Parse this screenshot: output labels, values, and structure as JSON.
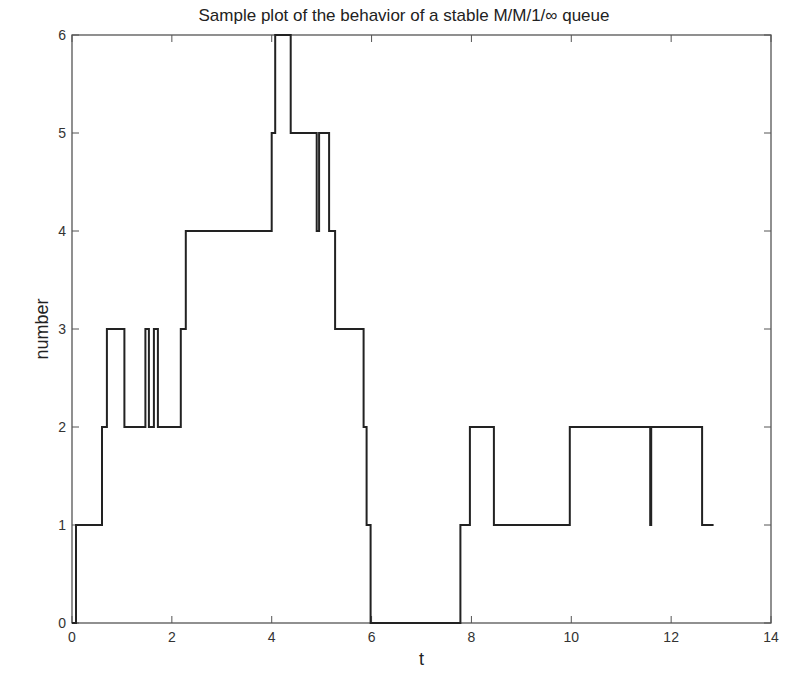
{
  "chart_data": {
    "type": "line",
    "subtype": "step",
    "title": "Sample plot of the behavior of a stable M/M/1/∞ queue",
    "xlabel": "t",
    "ylabel": "number",
    "xlim": [
      0,
      14
    ],
    "ylim": [
      0,
      6
    ],
    "xticks": [
      0,
      2,
      4,
      6,
      8,
      10,
      12,
      14
    ],
    "yticks": [
      0,
      1,
      2,
      3,
      4,
      5,
      6
    ],
    "grid": false,
    "legend": null,
    "series": [
      {
        "name": "queue length",
        "color": "#222222",
        "points": [
          [
            0.0,
            0
          ],
          [
            0.08,
            0
          ],
          [
            0.08,
            1
          ],
          [
            0.6,
            1
          ],
          [
            0.6,
            2
          ],
          [
            0.7,
            2
          ],
          [
            0.7,
            3
          ],
          [
            1.05,
            3
          ],
          [
            1.05,
            2
          ],
          [
            1.47,
            2
          ],
          [
            1.47,
            3
          ],
          [
            1.54,
            3
          ],
          [
            1.54,
            2
          ],
          [
            1.64,
            2
          ],
          [
            1.64,
            3
          ],
          [
            1.72,
            3
          ],
          [
            1.72,
            2
          ],
          [
            2.18,
            2
          ],
          [
            2.18,
            3
          ],
          [
            2.28,
            3
          ],
          [
            2.28,
            4
          ],
          [
            4.0,
            4
          ],
          [
            4.0,
            5
          ],
          [
            4.07,
            5
          ],
          [
            4.07,
            6
          ],
          [
            4.38,
            6
          ],
          [
            4.38,
            5
          ],
          [
            4.9,
            5
          ],
          [
            4.9,
            4
          ],
          [
            4.95,
            4
          ],
          [
            4.95,
            5
          ],
          [
            5.15,
            5
          ],
          [
            5.15,
            4
          ],
          [
            5.27,
            4
          ],
          [
            5.27,
            3
          ],
          [
            5.84,
            3
          ],
          [
            5.84,
            2
          ],
          [
            5.9,
            2
          ],
          [
            5.9,
            1
          ],
          [
            5.98,
            1
          ],
          [
            5.98,
            0
          ],
          [
            7.78,
            0
          ],
          [
            7.78,
            1
          ],
          [
            7.97,
            1
          ],
          [
            7.97,
            2
          ],
          [
            8.45,
            2
          ],
          [
            8.45,
            1
          ],
          [
            9.97,
            1
          ],
          [
            9.97,
            2
          ],
          [
            11.58,
            2
          ],
          [
            11.58,
            1
          ],
          [
            11.6,
            1
          ],
          [
            11.6,
            2
          ],
          [
            12.62,
            2
          ],
          [
            12.62,
            1
          ],
          [
            12.85,
            1
          ]
        ]
      }
    ]
  },
  "layout": {
    "plot_left": 72,
    "plot_right": 771,
    "plot_top": 35,
    "plot_bottom": 623
  }
}
